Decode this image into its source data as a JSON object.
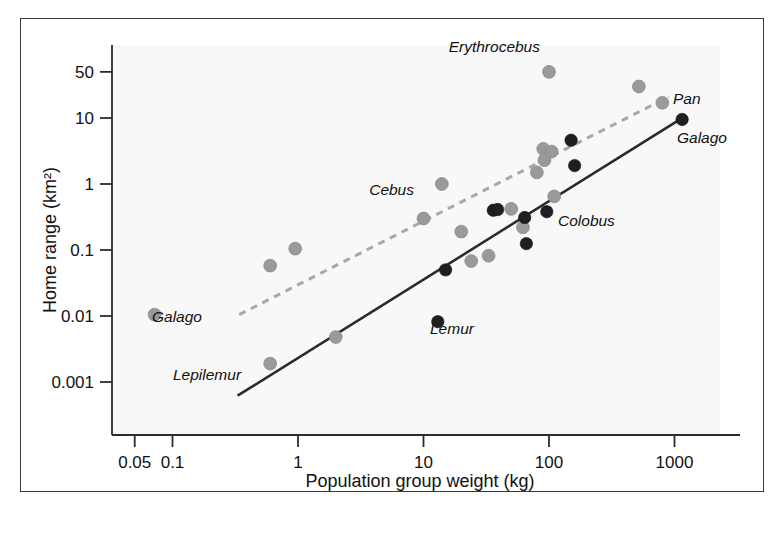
{
  "figure": {
    "border_color": "#3a3a3a",
    "background": "#ffffff"
  },
  "chart_data": {
    "type": "scatter",
    "title": "",
    "xlabel": "Population group weight (kg)",
    "ylabel": "Home range (km²)",
    "xscale": "log",
    "yscale": "log",
    "xlim": [
      0.05,
      2000
    ],
    "ylim": [
      0.0006,
      90
    ],
    "grid": false,
    "legend": "none",
    "xticks": [
      {
        "value": 0.05,
        "label": "0.05"
      },
      {
        "value": 0.1,
        "label": "0.1"
      },
      {
        "value": 1,
        "label": "1"
      },
      {
        "value": 10,
        "label": "10"
      },
      {
        "value": 100,
        "label": "100"
      },
      {
        "value": 1000,
        "label": "1000"
      }
    ],
    "yticks": [
      {
        "value": 50,
        "label": "50"
      },
      {
        "value": 10,
        "label": "10"
      },
      {
        "value": 1,
        "label": "1"
      },
      {
        "value": 0.1,
        "label": "0.1"
      },
      {
        "value": 0.01,
        "label": "0.01"
      },
      {
        "value": 0.001,
        "label": "0.001"
      }
    ],
    "series": [
      {
        "name": "frugivorous/omnivorous primates",
        "marker": "circle-gray",
        "color": "#9a9a9a",
        "points": [
          {
            "x": 0.072,
            "y": 0.0105
          },
          {
            "x": 0.6,
            "y": 0.058
          },
          {
            "x": 0.6,
            "y": 0.0019
          },
          {
            "x": 0.95,
            "y": 0.105
          },
          {
            "x": 2.0,
            "y": 0.0048
          },
          {
            "x": 10.0,
            "y": 0.3
          },
          {
            "x": 14.0,
            "y": 1.0
          },
          {
            "x": 20.0,
            "y": 0.19
          },
          {
            "x": 24.0,
            "y": 0.068
          },
          {
            "x": 33.0,
            "y": 0.082
          },
          {
            "x": 50.0,
            "y": 0.42
          },
          {
            "x": 62.0,
            "y": 0.22
          },
          {
            "x": 80.0,
            "y": 1.5
          },
          {
            "x": 90.0,
            "y": 3.4
          },
          {
            "x": 92.0,
            "y": 2.3
          },
          {
            "x": 100.0,
            "y": 50.0
          },
          {
            "x": 105.0,
            "y": 3.1
          },
          {
            "x": 110.0,
            "y": 0.65
          },
          {
            "x": 520.0,
            "y": 30.0
          },
          {
            "x": 800.0,
            "y": 17.0
          }
        ]
      },
      {
        "name": "folivorous primates",
        "marker": "circle-dark",
        "color": "#1f1f1f",
        "points": [
          {
            "x": 13.0,
            "y": 0.0082
          },
          {
            "x": 15.0,
            "y": 0.05
          },
          {
            "x": 36.0,
            "y": 0.4
          },
          {
            "x": 39.0,
            "y": 0.41
          },
          {
            "x": 64.0,
            "y": 0.31
          },
          {
            "x": 66.0,
            "y": 0.125
          },
          {
            "x": 96.0,
            "y": 0.38
          },
          {
            "x": 150.0,
            "y": 4.6
          },
          {
            "x": 160.0,
            "y": 1.9
          },
          {
            "x": 1150.0,
            "y": 9.5
          }
        ]
      }
    ],
    "fit_lines": [
      {
        "name": "folivore regression",
        "style": "solid",
        "color": "#2b2b2b",
        "x_start": 0.33,
        "y_start": 0.00062,
        "x_end": 1200.0,
        "y_end": 10.5
      },
      {
        "name": "frugivore regression",
        "style": "dashed",
        "color": "#a8a8a8",
        "x_start": 0.34,
        "y_start": 0.0105,
        "x_end": 900.0,
        "y_end": 21.0
      }
    ],
    "annotations": [
      {
        "text": "Erythrocebus",
        "x": 0.068,
        "y": 0.0,
        "px": 540,
        "py": 52,
        "anchor": "end"
      },
      {
        "text": "Pan",
        "x": 0.0,
        "y": 0.0,
        "px": 673,
        "py": 104,
        "anchor": "start"
      },
      {
        "text": "Galago",
        "x": 0.0,
        "y": 0.0,
        "px": 677,
        "py": 143,
        "anchor": "start"
      },
      {
        "text": "Cebus",
        "x": 0.0,
        "y": 0.0,
        "px": 414,
        "py": 195,
        "anchor": "end"
      },
      {
        "text": "Colobus",
        "x": 0.0,
        "y": 0.0,
        "px": 558,
        "py": 226,
        "anchor": "start"
      },
      {
        "text": "Galago",
        "x": 0.0,
        "y": 0.0,
        "px": 152,
        "py": 322,
        "anchor": "start"
      },
      {
        "text": "Lemur",
        "x": 0.0,
        "y": 0.0,
        "px": 430,
        "py": 334,
        "anchor": "start"
      },
      {
        "text": "Lepilemur",
        "x": 0.0,
        "y": 0.0,
        "px": 173,
        "py": 380,
        "anchor": "start"
      }
    ]
  }
}
